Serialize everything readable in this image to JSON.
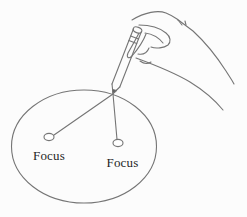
{
  "diagram": {
    "left_focus_label": "Focus",
    "right_focus_label": "Focus",
    "colors": {
      "background": "#fcfcfc",
      "line": "#757575",
      "text": "#1f1f1f",
      "pencil_tip": "#5a5a5a"
    }
  }
}
